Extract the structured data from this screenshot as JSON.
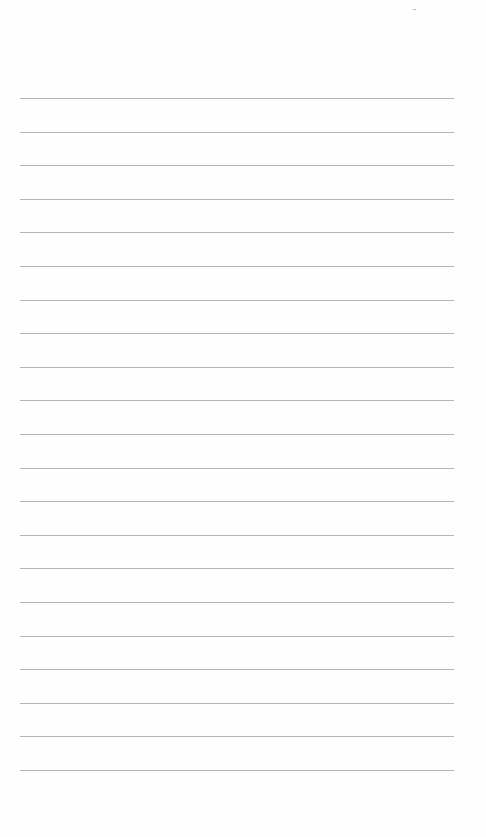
{
  "page": {
    "type": "ruled-notebook-page",
    "content": "",
    "line_count": 21,
    "first_line_y": 98,
    "line_spacing": 33.6,
    "line_left": 20,
    "line_right": 454,
    "colors": {
      "paper": "#fefefe",
      "rule": "#a9a9a9"
    }
  }
}
